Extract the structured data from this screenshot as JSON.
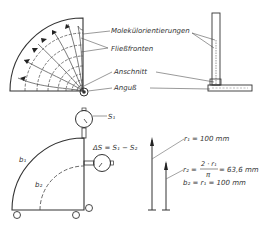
{
  "diagram": {
    "labels": {
      "molecule_orientation": "Molekülorientierungen",
      "flow_fronts": "Fließfronten",
      "gate": "Anschnitt",
      "sprue": "Anguß",
      "s1": "S₁",
      "delta_s": "ΔS = S₁ − S₂",
      "b1": "b₁",
      "b2": "b₂",
      "r1_eq": "r₁ = 100 mm",
      "r2_lhs": "r₂ =",
      "r2_num": "2 · r₁",
      "r2_den": "π",
      "r2_val": "= 63,6 mm",
      "b2_eq": "b₂ = r₁ = 100 mm"
    },
    "values": {
      "r1_mm": 100,
      "r2_mm": 63.6,
      "b2_mm": 100
    },
    "colors": {
      "line": "#333333",
      "background": "#ffffff"
    }
  }
}
